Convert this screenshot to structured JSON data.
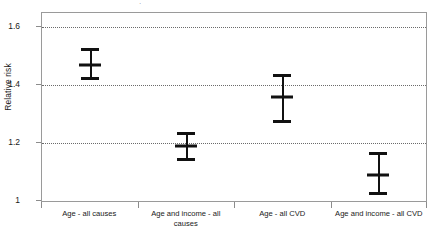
{
  "chart_data": {
    "type": "scatter",
    "title": "",
    "xlabel": "",
    "ylabel": "Relative risk",
    "ylim": [
      1,
      1.65
    ],
    "yticks": [
      1,
      1.2,
      1.4,
      1.6
    ],
    "ytick_labels": [
      "1",
      "1.2",
      "1.4",
      "1.6"
    ],
    "grid": "horizontal-dotted",
    "legend": "none",
    "categories": [
      "Age - all causes",
      "Age and income - all causes",
      "Age - all CVD",
      "Age and income - all CVD"
    ],
    "values": [
      1.47,
      1.19,
      1.36,
      1.09
    ],
    "ci_lower": [
      1.42,
      1.14,
      1.27,
      1.02
    ],
    "ci_upper": [
      1.53,
      1.24,
      1.44,
      1.17
    ],
    "series": [
      {
        "name": "Relative risk with 95% CI",
        "points": [
          {
            "category": "Age - all causes",
            "value": 1.47,
            "low": 1.42,
            "high": 1.53
          },
          {
            "category": "Age and income - all causes",
            "value": 1.19,
            "low": 1.14,
            "high": 1.24
          },
          {
            "category": "Age - all CVD",
            "value": 1.36,
            "low": 1.27,
            "high": 1.44
          },
          {
            "category": "Age and income - all CVD",
            "value": 1.09,
            "low": 1.02,
            "high": 1.17
          }
        ]
      }
    ],
    "marker_color": "#111111",
    "grid_color": "#6b6b6b",
    "frame_color": "#9a9a9a"
  },
  "axis": {
    "y_title": "Relative risk",
    "ytick_0": "1",
    "ytick_1": "1.2",
    "ytick_2": "1.4",
    "ytick_3": "1.6"
  },
  "xaxis": {
    "cat_0": "Age - all causes",
    "cat_1": "Age and income - all causes",
    "cat_2": "Age - all CVD",
    "cat_3": "Age and income - all CVD"
  },
  "title_remnant": "·"
}
